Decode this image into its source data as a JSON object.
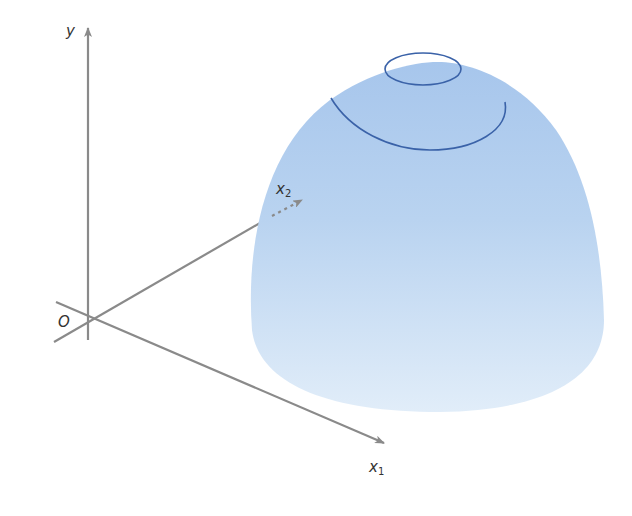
{
  "figure": {
    "axes": {
      "y": {
        "label": "y"
      },
      "origin": {
        "label": "O"
      },
      "x1": {
        "label": "x",
        "subscript": "1"
      },
      "x2": {
        "label": "x",
        "subscript": "2"
      }
    },
    "surface": {
      "shape": "dome",
      "fill_top_color": "#a9c8ec",
      "fill_bottom_color": "#deebf8",
      "contour_count": 2,
      "contour_color": "#3a62a8"
    },
    "colors": {
      "axis": "#8a8a8a",
      "text": "#333333",
      "background": "#ffffff"
    }
  }
}
